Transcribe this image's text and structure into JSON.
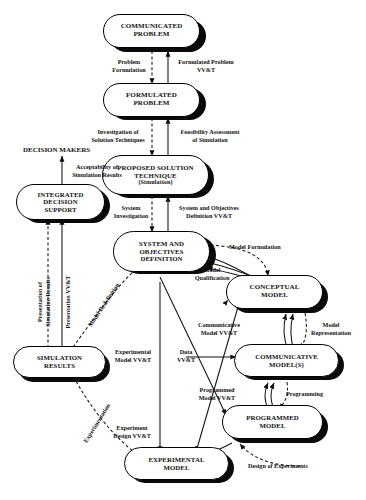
{
  "figure": {
    "kind": "flow-diagram",
    "top_artifact_text": ""
  },
  "nodes": [
    {
      "id": "communicated-problem",
      "lines": [
        "COMMUNICATED",
        "PROBLEM"
      ]
    },
    {
      "id": "formulated-problem",
      "lines": [
        "FORMULATED",
        "PROBLEM"
      ]
    },
    {
      "id": "proposed-solution-technique",
      "lines": [
        "PROPOSED SOLUTION",
        "TECHNIQUE",
        "(Simulation)"
      ]
    },
    {
      "id": "system-and-objectives-definition",
      "lines": [
        "SYSTEM AND",
        "OBJECTIVES",
        "DEFINITION"
      ]
    },
    {
      "id": "decision-makers",
      "lines": [
        "DECISION MAKERS"
      ]
    },
    {
      "id": "integrated-decision-support",
      "lines": [
        "INTEGRATED",
        "DECISION",
        "SUPPORT"
      ]
    },
    {
      "id": "simulation-results",
      "lines": [
        "SIMULATION",
        "RESULTS"
      ]
    },
    {
      "id": "conceptual-model",
      "lines": [
        "CONCEPTUAL",
        "MODEL"
      ]
    },
    {
      "id": "communicative-models",
      "lines": [
        "COMMUNICATIVE",
        "MODEL(S)"
      ]
    },
    {
      "id": "programmed-model",
      "lines": [
        "PROGRAMMED",
        "MODEL"
      ]
    },
    {
      "id": "experimental-model",
      "lines": [
        "EXPERIMENTAL",
        "MODEL"
      ]
    }
  ],
  "labels": {
    "problem_formulation": "Problem\nFormulation",
    "formulated_problem_vvt": "Formulated Problem\nVV&T",
    "investigation_of_solution_techniques": "Investigation of\nSolution Techniques",
    "feasibility_assessment_of_simulation": "Feasibility Assessment\nof Simulation",
    "system_investigation": "System\nInvestigation",
    "system_and_objectives_definition_vvt": "System and Objectives\nDefinition VV&T",
    "acceptability_of_simulation_results": "Acceptability of\nSimulation Results",
    "presentation_of_simulation_results": "Presentation of\nSimulation Results",
    "presentation_vvt": "Presentation VV&T",
    "model_redefinition": "Model Redefinition",
    "experimentation": "Experimentation",
    "model_formulation": "Model Formulation",
    "model_qualification": "Model\nQualification",
    "communicative_model_vvt": "Communicative\nModel VV&T",
    "model_representation": "Model\nRepresentation",
    "programmed_model_vvt": "Programmed\nModel VV&T",
    "programming": "Programming",
    "data_vvt": "Data\nVV&T",
    "experimental_model_vvt": "Experimental\nModel VV&T",
    "experiment_design_vvt": "Experiment\nDesign VV&T",
    "design_of_experiments": "Design of Experiments"
  },
  "colors": {
    "ink": "#111111",
    "paper": "#ffffff",
    "shadow": "#0a0a0a"
  }
}
